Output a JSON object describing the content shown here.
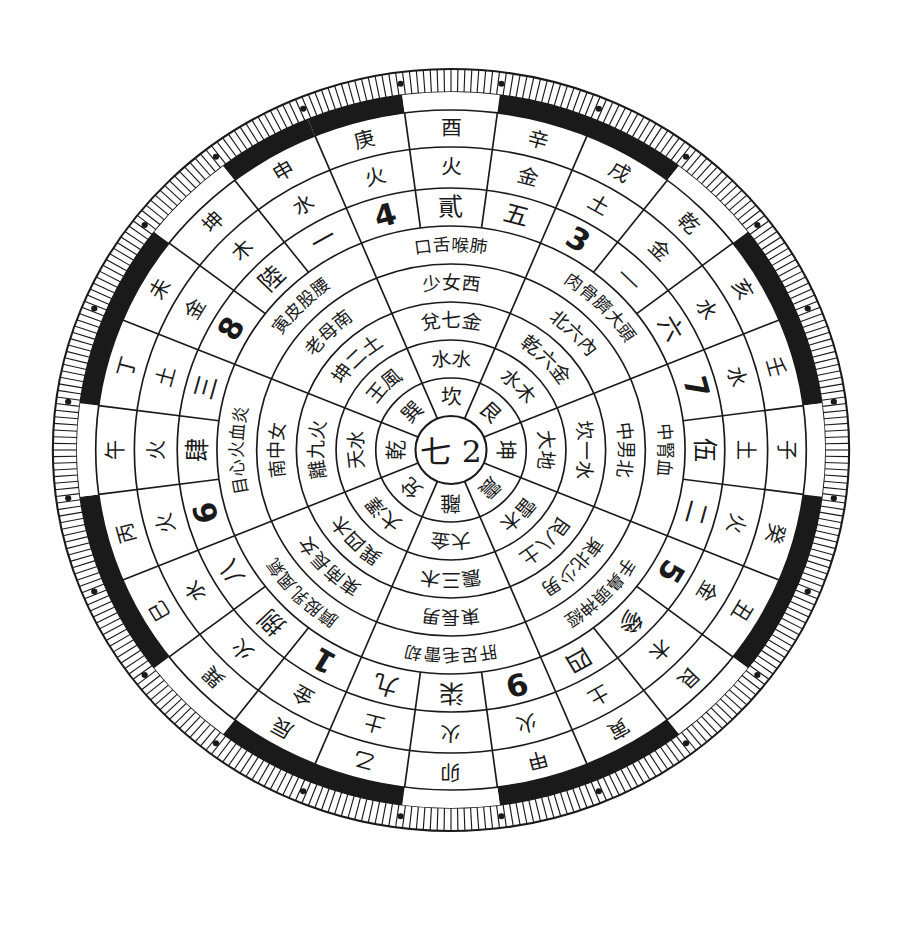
{
  "diagram": {
    "title": "",
    "center": {
      "text": "七 2"
    },
    "colors": {
      "ink": "#1a1a1a",
      "paper": "#ffffff"
    },
    "rings": {
      "ring1_trigrams": [
        "坎",
        "艮",
        "震",
        "巽",
        "離",
        "坤",
        "兌",
        "乾"
      ],
      "ring2_elements": [
        "水",
        "土",
        "木",
        "木",
        "火",
        "土",
        "金",
        "金"
      ],
      "ring2_full": [
        "水水",
        "木土",
        "地大",
        "雷木",
        "大金",
        "澤大",
        "天水",
        "風金"
      ],
      "ring3_numbers": [
        "一白",
        "二黑",
        "三碧",
        "四綠",
        "五黃",
        "六白",
        "七赤",
        "八白",
        "九紫"
      ],
      "ring4_family": [
        "兌七金",
        "坎六水",
        "坎一水",
        "艮八土",
        "震三木",
        "巽四木",
        "離九火",
        "坤二土"
      ],
      "ring5_people": [
        "少女",
        "中男",
        "中男",
        "少男",
        "長男",
        "長女",
        "中女",
        "老母"
      ],
      "ring6_body": [
        "口舌",
        "腎耳血",
        "北中男",
        "手鼻頭神經",
        "肝足毛雷",
        "膊股乳風氣",
        "目心火血炎",
        "腹皮膚"
      ],
      "ring7_star": [
        "五",
        "3",
        "六",
        "7",
        "伍",
        "二",
        "5",
        "參",
        "四",
        "9",
        "柒",
        "九",
        "1",
        "捌",
        "八",
        "6",
        "肆",
        "三",
        "8",
        "陸",
        "一",
        "4",
        "貳"
      ],
      "ring8_element": [
        "土",
        "水",
        "水",
        "火",
        "土",
        "金",
        "木",
        "水",
        "火",
        "火",
        "土",
        "金",
        "木",
        "水",
        "火",
        "火",
        "土",
        "金",
        "木",
        "水",
        "火",
        "火",
        "土"
      ],
      "ring9_mountains": [
        "子",
        "壬",
        "亥",
        "乾",
        "戌",
        "辛",
        "酉",
        "庚",
        "申",
        "坤",
        "未",
        "丁",
        "午",
        "丙",
        "巳",
        "巽",
        "辰",
        "乙",
        "卯",
        "甲",
        "寅",
        "艮",
        "丑",
        "癸"
      ]
    },
    "labels": {
      "top_mountain": "酉",
      "bottom_mountain": "卯",
      "left_mountain": "午",
      "right_mountain": "子"
    }
  }
}
